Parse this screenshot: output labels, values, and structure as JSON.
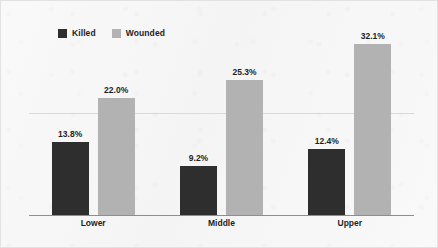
{
  "chart_data": {
    "type": "bar",
    "title": "",
    "subtitle": "",
    "xlabel": "",
    "ylabel": "",
    "categories": [
      "Lower",
      "Middle",
      "Upper"
    ],
    "series": [
      {
        "name": "Killed",
        "color": "#2e2e2e",
        "values": [
          13.8,
          12.4,
          9.2
        ],
        "values_by_category": [
          13.8,
          9.2,
          12.4
        ],
        "labels": [
          "13.8%",
          "9.2%",
          "12.4%"
        ]
      },
      {
        "name": "Wounded",
        "color": "#b2b2b2",
        "values": [
          22.0,
          25.3,
          32.1
        ],
        "values_by_category": [
          22.0,
          25.3,
          32.1
        ],
        "labels": [
          "22.0%",
          "25.3%",
          "32.1%"
        ]
      }
    ],
    "ylim": [
      0,
      35
    ],
    "grid": true,
    "gridlines": [
      17.5
    ],
    "legend_position": "top-left",
    "value_labels": true,
    "axis_tick_labels": []
  },
  "legend": {
    "entries": [
      {
        "label": "Killed",
        "swatch_color": "#2e2e2e"
      },
      {
        "label": "Wounded",
        "swatch_color": "#b2b2b2"
      }
    ]
  },
  "groups": [
    {
      "category": "Lower",
      "bars": [
        {
          "series": "Killed",
          "label": "13.8%",
          "value": 13.8,
          "color": "#2e2e2e",
          "height_px": 73
        },
        {
          "series": "Wounded",
          "label": "22.0%",
          "value": 22.0,
          "color": "#b2b2b2",
          "height_px": 117
        }
      ]
    },
    {
      "category": "Middle",
      "bars": [
        {
          "series": "Killed",
          "label": "9.2%",
          "value": 9.2,
          "color": "#2e2e2e",
          "height_px": 49
        },
        {
          "series": "Wounded",
          "label": "25.3%",
          "value": 25.3,
          "color": "#b2b2b2",
          "height_px": 135
        }
      ]
    },
    {
      "category": "Upper",
      "bars": [
        {
          "series": "Killed",
          "label": "12.4%",
          "value": 12.4,
          "color": "#2e2e2e",
          "height_px": 66
        },
        {
          "series": "Wounded",
          "label": "32.1%",
          "value": 32.1,
          "color": "#b2b2b2",
          "height_px": 171
        }
      ]
    }
  ],
  "colors": {
    "background": "#f7f7f7",
    "frame_border": "#e2e2e2",
    "axis_line": "#8e8e8e",
    "gridline": "#d9d9d9",
    "killed": "#2e2e2e",
    "wounded": "#b2b2b2",
    "text": "#1f1f1f"
  }
}
